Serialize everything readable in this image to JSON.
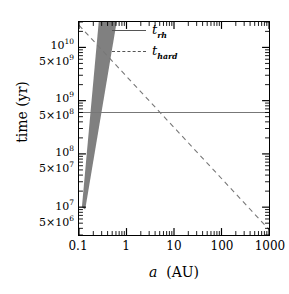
{
  "chart_data": {
    "type": "line",
    "title": "",
    "xlabel": "a  (AU)",
    "ylabel": "time (yr)",
    "xscale": "log",
    "yscale": "log",
    "xlim": [
      0.1,
      1000
    ],
    "ylim": [
      3000000,
      30000000000
    ],
    "grid": false,
    "legend_position": "top-center",
    "xticks": [
      {
        "value": 0.1,
        "label": "0.1"
      },
      {
        "value": 1,
        "label": "1"
      },
      {
        "value": 10,
        "label": "10"
      },
      {
        "value": 100,
        "label": "100"
      },
      {
        "value": 1000,
        "label": "1000"
      }
    ],
    "yticks": [
      {
        "value": 5000000,
        "mantissa": "5×10",
        "exponent": "6"
      },
      {
        "value": 10000000,
        "mantissa": "10",
        "exponent": "7"
      },
      {
        "value": 50000000,
        "mantissa": "5×10",
        "exponent": "7"
      },
      {
        "value": 100000000,
        "mantissa": "10",
        "exponent": "8"
      },
      {
        "value": 500000000,
        "mantissa": "5×10",
        "exponent": "8"
      },
      {
        "value": 1000000000,
        "mantissa": "10",
        "exponent": "9"
      },
      {
        "value": 5000000000,
        "mantissa": "5×10",
        "exponent": "9"
      },
      {
        "value": 10000000000,
        "mantissa": "10",
        "exponent": "10"
      }
    ],
    "series": [
      {
        "name": "t_rh",
        "legend_symbol": "t",
        "legend_subscript": "rh",
        "style": "solid",
        "color": "#777777",
        "description": "constant relaxation time",
        "points": [
          {
            "x": 0.1,
            "y": 600000000
          },
          {
            "x": 1000,
            "y": 600000000
          }
        ]
      },
      {
        "name": "t_hard",
        "legend_symbol": "t",
        "legend_subscript": "hard",
        "style": "dashed",
        "color": "#777777",
        "description": "hardening timescale, decreasing with separation",
        "points": [
          {
            "x": 0.1,
            "y": 26000000000
          },
          {
            "x": 1000,
            "y": 3800000
          }
        ]
      }
    ],
    "shaded_regions": [
      {
        "name": "wedge",
        "color": "#808080",
        "description": "grey wedge converging near a=0.1 AU at low time and widening toward high time",
        "vertices": [
          {
            "x": 0.115,
            "y": 10000000
          },
          {
            "x": 0.26,
            "y": 30000000000
          },
          {
            "x": 0.62,
            "y": 30000000000
          },
          {
            "x": 0.135,
            "y": 9000000
          }
        ]
      }
    ]
  },
  "axis_titles": {
    "x_italic": "a",
    "x_unit": "(AU)",
    "y": "time (yr)"
  }
}
